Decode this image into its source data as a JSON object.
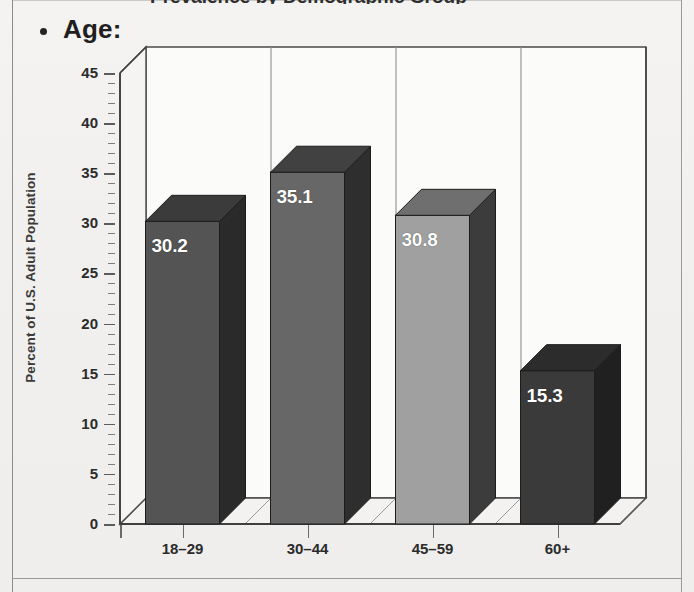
{
  "document": {
    "cut_heading_fragment": "Prevalence by Demographic Group",
    "bullet_heading": "Age:"
  },
  "chart_data": {
    "type": "bar",
    "title": "",
    "subtitle": "",
    "xlabel": "",
    "ylabel": "Percent of U.S. Adult Population",
    "categories": [
      "18–29",
      "30–44",
      "45–59",
      "60+"
    ],
    "values": [
      30.2,
      35.1,
      30.8,
      15.3
    ],
    "data_labels": [
      "30.2",
      "35.1",
      "30.8",
      "15.3"
    ],
    "ylim": [
      0,
      45
    ],
    "ytick_step": 5,
    "yticks": [
      0,
      5,
      10,
      15,
      20,
      25,
      30,
      35,
      40,
      45
    ],
    "ytick_labels": [
      "0",
      "5",
      "10",
      "15",
      "20",
      "25",
      "30",
      "35",
      "40",
      "45"
    ],
    "minor_ticks": true,
    "grid": "vertical-category-separators",
    "legend": "none",
    "style": "3d-bars",
    "series": [
      {
        "name": "Percent of U.S. Adult Population",
        "values": [
          30.2,
          35.1,
          30.8,
          15.3
        ]
      }
    ],
    "bar_colors": [
      "#545454",
      "#676767",
      "#a0a0a0",
      "#3a3a3a"
    ],
    "bar_side_colors": [
      "#2a2a2a",
      "#2e2e2e",
      "#3c3c3c",
      "#202020"
    ],
    "bar_top_colors": [
      "#3b3b3b",
      "#414141",
      "#6f6f6f",
      "#2c2c2c"
    ],
    "axis_color": "#5b5b5b",
    "background": "#f1f0ee"
  }
}
